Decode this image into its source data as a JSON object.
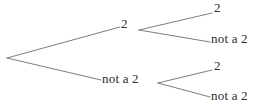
{
  "diagram": {
    "type": "probability-tree",
    "background_color": "#ffffff",
    "line_color": "#6e6e6e",
    "text_color": "#2b2b2b",
    "canvas": {
      "width": 266,
      "height": 103
    },
    "root": {
      "x": 7,
      "y": 58
    },
    "nodes": {
      "level1": [
        {
          "id": "l1-top",
          "label": "2",
          "x": 121,
          "y": 17,
          "branch_end_x": 120,
          "branch_end_y": 27
        },
        {
          "id": "l1-bottom",
          "label": "not a 2",
          "x": 102,
          "y": 72,
          "branch_end_x": 101,
          "branch_end_y": 80
        }
      ],
      "level2": [
        {
          "id": "l2-a",
          "label": "2",
          "x": 214,
          "y": 1,
          "parent": "l1-top",
          "from_x": 139,
          "from_y": 30,
          "to_x": 212,
          "to_y": 13
        },
        {
          "id": "l2-b",
          "label": "not a 2",
          "x": 211,
          "y": 32,
          "parent": "l1-top",
          "from_x": 139,
          "from_y": 30,
          "to_x": 210,
          "to_y": 42
        },
        {
          "id": "l2-c",
          "label": "2",
          "x": 214,
          "y": 59,
          "parent": "l1-bottom",
          "from_x": 158,
          "from_y": 83,
          "to_x": 212,
          "to_y": 70
        },
        {
          "id": "l2-d",
          "label": "not a 2",
          "x": 211,
          "y": 89,
          "parent": "l1-bottom",
          "from_x": 158,
          "from_y": 83,
          "to_x": 210,
          "to_y": 97
        }
      ]
    },
    "edges": [
      {
        "id": "edge-root-top",
        "x1": 7,
        "y1": 58,
        "x2": 120,
        "y2": 27
      },
      {
        "id": "edge-root-bottom",
        "x1": 7,
        "y1": 58,
        "x2": 101,
        "y2": 80
      },
      {
        "id": "edge-top-a",
        "x1": 139,
        "y1": 30,
        "x2": 212,
        "y2": 13
      },
      {
        "id": "edge-top-b",
        "x1": 139,
        "y1": 30,
        "x2": 210,
        "y2": 42
      },
      {
        "id": "edge-bottom-c",
        "x1": 158,
        "y1": 83,
        "x2": 212,
        "y2": 70
      },
      {
        "id": "edge-bottom-d",
        "x1": 158,
        "y1": 83,
        "x2": 210,
        "y2": 97
      }
    ]
  }
}
